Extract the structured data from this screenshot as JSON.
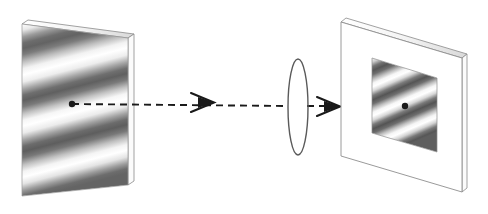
{
  "scene": {
    "title": "Optical imaging of a sinusoidal grating through a lens",
    "type": "optics-ray-diagram",
    "width": 488,
    "height": 214,
    "background_color": "#ffffff",
    "stroke_color": "#4a4a4a",
    "axis_color": "#1a1a1a",
    "grating_dark": "#5c5c5c",
    "grating_light": "#ffffff",
    "edge_highlight": "#f2f2f2"
  },
  "object_plane": {
    "label": "object-grating-plate",
    "description": "Tilted rectangular plate carrying a horizontal sinusoidal intensity grating",
    "corners": [
      [
        22,
        24
      ],
      [
        128,
        38
      ],
      [
        128,
        185
      ],
      [
        22,
        196
      ]
    ],
    "thickness_px": 6,
    "stripe_count": 5,
    "stripe_angle_deg": 8,
    "center_point": [
      72,
      104
    ]
  },
  "lens": {
    "label": "thin-converging-lens",
    "center": [
      298,
      107
    ],
    "radius_x": 10,
    "radius_y": 48,
    "outline_color": "#5a5a5a"
  },
  "image_plane": {
    "label": "image-screen-plate",
    "description": "Tilted white screen plate bearing the demagnified grating image",
    "corners": [
      [
        341,
        22
      ],
      [
        462,
        58
      ],
      [
        462,
        192
      ],
      [
        341,
        156
      ]
    ],
    "thickness_px": 6,
    "inner_panel_corners": [
      [
        372,
        58
      ],
      [
        437,
        78
      ],
      [
        437,
        152
      ],
      [
        372,
        133
      ]
    ],
    "stripe_count": 5,
    "stripe_angle_deg": 16,
    "center_point": [
      405,
      106
    ]
  },
  "optical_axis": {
    "label": "optical-axis",
    "style": "dashed",
    "dash_pattern": "7 5",
    "from": [
      72,
      104
    ],
    "to": [
      405,
      106
    ],
    "arrowheads": [
      {
        "name": "arrowhead-object-to-lens",
        "x": 205,
        "y": 102,
        "direction": "right"
      },
      {
        "name": "arrowhead-lens-to-image",
        "x": 331,
        "y": 106,
        "direction": "right"
      }
    ],
    "endpoint_dots": [
      {
        "name": "object-axis-point",
        "x": 72,
        "y": 104,
        "r": 3.2
      },
      {
        "name": "image-axis-point",
        "x": 405,
        "y": 106,
        "r": 3.2
      }
    ]
  }
}
